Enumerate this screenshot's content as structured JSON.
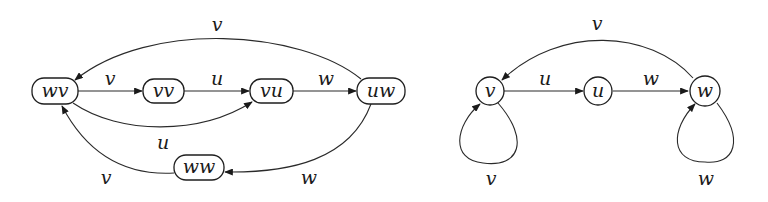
{
  "diagram": {
    "type": "directed-graph-pair",
    "left_graph": {
      "nodes": [
        {
          "id": "wv",
          "label": "wv"
        },
        {
          "id": "vv",
          "label": "vv"
        },
        {
          "id": "vu",
          "label": "vu"
        },
        {
          "id": "uw",
          "label": "uw"
        },
        {
          "id": "ww",
          "label": "ww"
        }
      ],
      "edges": [
        {
          "from": "wv",
          "to": "vv",
          "label": "v"
        },
        {
          "from": "vv",
          "to": "vu",
          "label": "u"
        },
        {
          "from": "vu",
          "to": "uw",
          "label": "w"
        },
        {
          "from": "uw",
          "to": "wv",
          "label": "v"
        },
        {
          "from": "wv",
          "to": "vu",
          "label": "u"
        },
        {
          "from": "uw",
          "to": "ww",
          "label": "w"
        },
        {
          "from": "ww",
          "to": "wv",
          "label": "v"
        }
      ]
    },
    "right_graph": {
      "nodes": [
        {
          "id": "v",
          "label": "v"
        },
        {
          "id": "u",
          "label": "u"
        },
        {
          "id": "w",
          "label": "w"
        }
      ],
      "edges": [
        {
          "from": "v",
          "to": "u",
          "label": "u"
        },
        {
          "from": "u",
          "to": "w",
          "label": "w"
        },
        {
          "from": "w",
          "to": "v",
          "label": "v"
        },
        {
          "from": "v",
          "to": "v",
          "label": "v"
        },
        {
          "from": "w",
          "to": "w",
          "label": "w"
        }
      ]
    }
  }
}
